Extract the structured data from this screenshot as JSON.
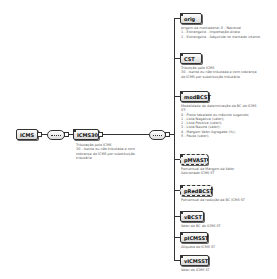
{
  "root": {
    "name": "ICMS"
  },
  "choice": {
    "name": "ICMS30",
    "doc": "Tributação pelo ICMS\n30 - Isenta ou não tributada e com cobrança do ICMS por substituição tributária"
  },
  "children": [
    {
      "name": "orig",
      "doc": "origem da mercadoria: 0 - Nacional\n1 - Estrangeira - Importação direta\n2 - Estrangeira - Adquirida no mercado interno",
      "optional": false
    },
    {
      "name": "CST",
      "doc": "Tributção pelo ICMS\n30 - Isenta ou não tributada e com cobrança do ICMS por substituição tributária",
      "optional": false
    },
    {
      "name": "modBCST",
      "doc": "Modalidade de determinação da BC do ICMS ST:\n0 - Preço tabelado ou máximo sugerido;\n1 - Lista Negativa (valor);\n2 - Lista Positiva (valor);\n3 - Lista Neutra (valor);\n4 - Margem Valor Agregado (%);\n5 - Pauta (valor).",
      "optional": false
    },
    {
      "name": "pMVAST",
      "doc": "Percentual da Margem de Valor Adicionado ICMS ST",
      "optional": true
    },
    {
      "name": "pRedBCST",
      "doc": "Percentual da redução da BC ICMS ST",
      "optional": true
    },
    {
      "name": "vBCST",
      "doc": "Valor da BC do ICMS ST",
      "optional": false
    },
    {
      "name": "pICMSST",
      "doc": "Alíquota do ICMS ST",
      "optional": false
    },
    {
      "name": "vICMSST",
      "doc": "Valor do ICMS ST",
      "optional": false
    }
  ]
}
